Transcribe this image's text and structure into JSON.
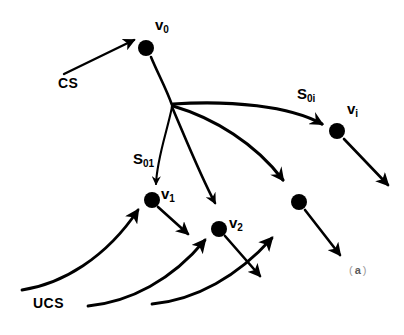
{
  "figure": {
    "caption_open": "(",
    "caption_letter": "a",
    "caption_close": ")",
    "stroke_color": "#000000",
    "background_color": "#ffffff"
  },
  "nodes": [
    {
      "id": "v0",
      "base": "v",
      "sub": "0",
      "x": 146,
      "y": 48,
      "r": 8,
      "label_x": 155,
      "label_y": 24
    },
    {
      "id": "vi",
      "base": "v",
      "sub": "i",
      "x": 337,
      "y": 131,
      "r": 8,
      "label_x": 347,
      "label_y": 108
    },
    {
      "id": "v1",
      "base": "v",
      "sub": "1",
      "x": 152,
      "y": 200,
      "r": 8,
      "label_x": 161,
      "label_y": 192
    },
    {
      "id": "v2",
      "base": "v",
      "sub": "2",
      "x": 219,
      "y": 229,
      "r": 8,
      "label_x": 229,
      "label_y": 220
    },
    {
      "id": "vn",
      "base": "",
      "sub": "",
      "x": 299,
      "y": 202,
      "r": 8,
      "label_x": 0,
      "label_y": 0
    }
  ],
  "hub": {
    "x": 172,
    "y": 105
  },
  "edge_labels": [
    {
      "id": "s0i",
      "base": "S",
      "sub": "0i",
      "x": 297,
      "y": 92
    },
    {
      "id": "s01",
      "base": "S",
      "sub": "01",
      "x": 133,
      "y": 157
    }
  ],
  "text_labels": [
    {
      "id": "cs",
      "text": "CS",
      "x": 58,
      "y": 82
    },
    {
      "id": "ucs",
      "text": "UCS",
      "x": 33,
      "y": 303
    }
  ]
}
